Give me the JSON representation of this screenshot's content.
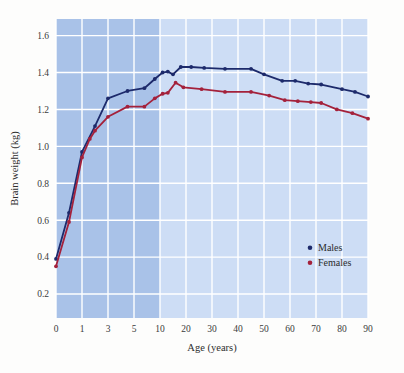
{
  "chart_data": {
    "type": "line",
    "title": "",
    "xlabel": "Age (years)",
    "ylabel": "Brain weight (kg)",
    "x_tick_labels": [
      "0",
      "1",
      "3",
      "5",
      "10",
      "20",
      "30",
      "40",
      "50",
      "60",
      "70",
      "80",
      "90"
    ],
    "x_tick_values": [
      0,
      1,
      3,
      5,
      10,
      20,
      30,
      40,
      50,
      60,
      70,
      80,
      90
    ],
    "y_tick_labels": [
      "0.2",
      "0.4",
      "0.6",
      "0.8",
      "1.0",
      "1.2",
      "1.4",
      "1.6"
    ],
    "y_tick_values": [
      0.2,
      0.4,
      0.6,
      0.8,
      1.0,
      1.2,
      1.4,
      1.6
    ],
    "ylim": [
      0.07,
      1.69
    ],
    "grid": true,
    "legend_position": "lower-right-inside",
    "plot_bg_light": "#cdddf5",
    "plot_bg_dark": "#a9c2e8",
    "shaded_region": {
      "from_age": 0,
      "to_age": 10,
      "note": "darker blue band covering childhood ages 0-10"
    },
    "gridline_color": "#ffffff",
    "series": [
      {
        "name": "Males",
        "color": "#1d2a6b",
        "points": [
          {
            "age": 0,
            "weight": 0.39
          },
          {
            "age": 0.5,
            "weight": 0.64
          },
          {
            "age": 1,
            "weight": 0.97
          },
          {
            "age": 2,
            "weight": 1.11
          },
          {
            "age": 3,
            "weight": 1.26
          },
          {
            "age": 4.5,
            "weight": 1.3
          },
          {
            "age": 7,
            "weight": 1.315
          },
          {
            "age": 9,
            "weight": 1.365
          },
          {
            "age": 11,
            "weight": 1.4
          },
          {
            "age": 13,
            "weight": 1.405
          },
          {
            "age": 15,
            "weight": 1.39
          },
          {
            "age": 18,
            "weight": 1.43
          },
          {
            "age": 22,
            "weight": 1.43
          },
          {
            "age": 27,
            "weight": 1.425
          },
          {
            "age": 35,
            "weight": 1.42
          },
          {
            "age": 45,
            "weight": 1.42
          },
          {
            "age": 50,
            "weight": 1.39
          },
          {
            "age": 57,
            "weight": 1.355
          },
          {
            "age": 62,
            "weight": 1.355
          },
          {
            "age": 67,
            "weight": 1.34
          },
          {
            "age": 72,
            "weight": 1.335
          },
          {
            "age": 80,
            "weight": 1.31
          },
          {
            "age": 85,
            "weight": 1.295
          },
          {
            "age": 90,
            "weight": 1.27
          }
        ]
      },
      {
        "name": "Females",
        "color": "#a4213b",
        "points": [
          {
            "age": 0,
            "weight": 0.35
          },
          {
            "age": 0.5,
            "weight": 0.59
          },
          {
            "age": 1,
            "weight": 0.94
          },
          {
            "age": 1.6,
            "weight": 1.04
          },
          {
            "age": 2,
            "weight": 1.085
          },
          {
            "age": 3,
            "weight": 1.16
          },
          {
            "age": 4.5,
            "weight": 1.215
          },
          {
            "age": 7,
            "weight": 1.215
          },
          {
            "age": 9,
            "weight": 1.26
          },
          {
            "age": 11,
            "weight": 1.285
          },
          {
            "age": 13,
            "weight": 1.29
          },
          {
            "age": 16,
            "weight": 1.345
          },
          {
            "age": 19,
            "weight": 1.32
          },
          {
            "age": 26,
            "weight": 1.31
          },
          {
            "age": 35,
            "weight": 1.295
          },
          {
            "age": 45,
            "weight": 1.295
          },
          {
            "age": 52,
            "weight": 1.275
          },
          {
            "age": 58,
            "weight": 1.25
          },
          {
            "age": 63,
            "weight": 1.245
          },
          {
            "age": 68,
            "weight": 1.24
          },
          {
            "age": 72,
            "weight": 1.235
          },
          {
            "age": 78,
            "weight": 1.2
          },
          {
            "age": 84,
            "weight": 1.18
          },
          {
            "age": 90,
            "weight": 1.15
          }
        ]
      }
    ],
    "legend": [
      {
        "label": "Males",
        "color": "#1d2a6b"
      },
      {
        "label": "Females",
        "color": "#a4213b"
      }
    ]
  }
}
